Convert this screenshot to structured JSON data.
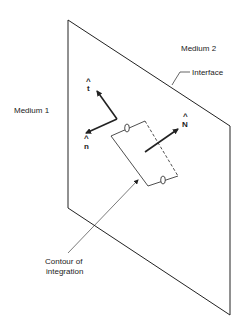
{
  "diagram": {
    "labels": {
      "medium1": "Medium 1",
      "medium2": "Medium 2",
      "interface": "Interface",
      "contour_line1": "Contour of",
      "contour_line2": "integration"
    },
    "vectors": {
      "t": "t",
      "n": "n",
      "N": "N",
      "hat": "^"
    },
    "colors": {
      "line": "#222222",
      "background": "#ffffff"
    }
  }
}
